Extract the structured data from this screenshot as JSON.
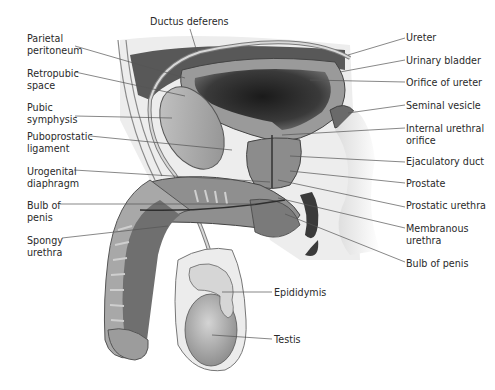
{
  "figure": {
    "labels_left": [
      {
        "id": "parietal-peritoneum",
        "lines": [
          "Parietal",
          "peritoneum"
        ],
        "x": 27,
        "y": 33,
        "anchor": [
          75,
          46
        ],
        "target": [
          185,
          78
        ]
      },
      {
        "id": "retropubic-space",
        "lines": [
          "Retropubic",
          "space"
        ],
        "x": 27,
        "y": 68,
        "anchor": [
          75,
          72
        ],
        "target": [
          185,
          96
        ]
      },
      {
        "id": "pubic-symphysis",
        "lines": [
          "Pubic",
          "symphysis"
        ],
        "x": 27,
        "y": 102,
        "anchor": [
          75,
          116
        ],
        "target": [
          172,
          118
        ]
      },
      {
        "id": "puboprostatic-ligament",
        "lines": [
          "Puboprostatic",
          "ligament"
        ],
        "x": 27,
        "y": 131,
        "anchor": [
          90,
          136
        ],
        "target": [
          232,
          150
        ]
      },
      {
        "id": "urogenital-diaphragm",
        "lines": [
          "Urogenital",
          "diaphragm"
        ],
        "x": 27,
        "y": 166,
        "anchor": [
          74,
          170
        ],
        "target": [
          270,
          182
        ]
      },
      {
        "id": "bulb-of-penis-left",
        "lines": [
          "Bulb of",
          "penis"
        ],
        "x": 27,
        "y": 200,
        "anchor": [
          60,
          204
        ],
        "target": [
          255,
          204
        ]
      },
      {
        "id": "spongy-urethra",
        "lines": [
          "Spongy",
          "urethra"
        ],
        "x": 27,
        "y": 235,
        "anchor": [
          62,
          238
        ],
        "target": [
          168,
          226
        ]
      }
    ],
    "labels_right": [
      {
        "id": "ureter",
        "lines": [
          "Ureter"
        ],
        "x": 406,
        "y": 32,
        "anchor": [
          405,
          38
        ],
        "target": [
          348,
          55
        ]
      },
      {
        "id": "urinary-bladder",
        "lines": [
          "Urinary bladder"
        ],
        "x": 406,
        "y": 55,
        "anchor": [
          405,
          60
        ],
        "target": [
          340,
          72
        ]
      },
      {
        "id": "orifice-of-ureter",
        "lines": [
          "Orifice of ureter"
        ],
        "x": 406,
        "y": 77,
        "anchor": [
          405,
          82
        ],
        "target": [
          310,
          80
        ]
      },
      {
        "id": "seminal-vesicle",
        "lines": [
          "Seminal vesicle"
        ],
        "x": 406,
        "y": 100,
        "anchor": [
          405,
          105
        ],
        "target": [
          348,
          113
        ]
      },
      {
        "id": "internal-urethral-orifice",
        "lines": [
          "Internal urethral",
          "orifice"
        ],
        "x": 406,
        "y": 123,
        "anchor": [
          405,
          128
        ],
        "target": [
          282,
          135
        ]
      },
      {
        "id": "ejaculatory-duct",
        "lines": [
          "Ejaculatory duct"
        ],
        "x": 406,
        "y": 156,
        "anchor": [
          405,
          162
        ],
        "target": [
          290,
          156
        ]
      },
      {
        "id": "prostate",
        "lines": [
          "Prostate"
        ],
        "x": 406,
        "y": 178,
        "anchor": [
          405,
          183
        ],
        "target": [
          290,
          171
        ]
      },
      {
        "id": "prostatic-urethra",
        "lines": [
          "Prostatic urethra"
        ],
        "x": 406,
        "y": 200,
        "anchor": [
          405,
          207
        ],
        "target": [
          278,
          180
        ]
      },
      {
        "id": "membranous-urethra",
        "lines": [
          "Membranous",
          "urethra"
        ],
        "x": 406,
        "y": 223,
        "anchor": [
          405,
          228
        ],
        "target": [
          278,
          198
        ]
      },
      {
        "id": "bulb-of-penis-right",
        "lines": [
          "Bulb of penis"
        ],
        "x": 406,
        "y": 258,
        "anchor": [
          405,
          262
        ],
        "target": [
          285,
          214
        ]
      }
    ],
    "labels_top": [
      {
        "id": "ductus-deferens",
        "lines": [
          "Ductus deferens"
        ],
        "x": 150,
        "y": 16,
        "anchor": [
          190,
          29
        ],
        "target": [
          197,
          52
        ]
      }
    ],
    "labels_bottom": [
      {
        "id": "epididymis",
        "lines": [
          "Epididymis"
        ],
        "x": 274,
        "y": 287,
        "anchor": [
          272,
          292
        ],
        "target": [
          222,
          292
        ]
      },
      {
        "id": "testis",
        "lines": [
          "Testis"
        ],
        "x": 274,
        "y": 334,
        "anchor": [
          272,
          339
        ],
        "target": [
          212,
          335
        ]
      }
    ]
  },
  "colors": {
    "label_text": "#2a2a2a",
    "leader_line": "#555555",
    "tissue_light": "#d6d6d6",
    "tissue_mid": "#9a9a9a",
    "tissue_dark": "#4a4a4a",
    "lumen": "#1e1e1e"
  }
}
